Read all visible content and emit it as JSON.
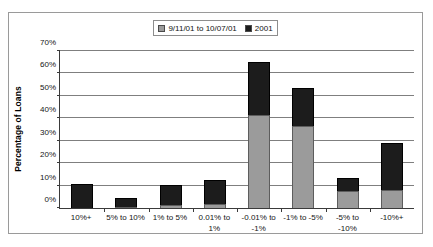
{
  "chart_data": {
    "type": "bar",
    "subtype": "stacked-column",
    "title": "",
    "xlabel": "",
    "ylabel": "Percentage of Loans",
    "ylim": [
      0,
      70
    ],
    "y_ticks": [
      "0%",
      "10%",
      "20%",
      "30%",
      "40%",
      "50%",
      "60%",
      "70%"
    ],
    "y_tick_values": [
      0,
      10,
      20,
      30,
      40,
      50,
      60,
      70
    ],
    "grid": true,
    "legend_position": "top-center",
    "categories": [
      "10%+",
      "5% to 10%",
      "1% to 5%",
      "0.01% to 1%",
      "-0.01% to -1%",
      "-1% to -5%",
      "-5% to -10%",
      "-10%+"
    ],
    "series": [
      {
        "name": "9/11/01 to 10/07/01",
        "color": "#9b9b9b",
        "values": [
          0.0,
          0.4,
          1.5,
          1.6,
          41.3,
          36.2,
          7.4,
          8.0
        ]
      },
      {
        "name": "2001",
        "color": "#1c1c1c",
        "values": [
          10.5,
          4.2,
          8.5,
          11.0,
          23.2,
          16.8,
          5.8,
          21.0
        ]
      }
    ],
    "stack_totals": [
      10.5,
      4.6,
      10.0,
      12.6,
      64.5,
      53.0,
      13.2,
      29.0
    ]
  },
  "legend": {
    "entries": [
      {
        "label": "9/11/01 to 10/07/01",
        "color": "#9b9b9b"
      },
      {
        "label": "2001",
        "color": "#1c1c1c"
      }
    ]
  },
  "axes": {
    "y_title": "Percentage of Loans"
  }
}
